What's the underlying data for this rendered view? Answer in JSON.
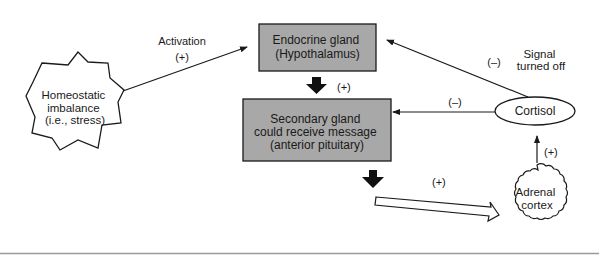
{
  "diagram": {
    "nodes": {
      "stress": {
        "lines": [
          "Homeostatic",
          "imbalance",
          "(i.e., stress)"
        ]
      },
      "endocrine": {
        "lines": [
          "Endocrine gland",
          "(Hypothalamus)"
        ]
      },
      "secondary": {
        "lines": [
          "Secondary gland",
          "could receive message",
          "(anterior pituitary)"
        ]
      },
      "cortisol": {
        "label": "Cortisol"
      },
      "adrenal": {
        "lines": [
          "Adrenal",
          "cortex"
        ]
      }
    },
    "edges": {
      "activation_label": "Activation",
      "activation_sign": "(+)",
      "endo_to_secondary_sign": "(+)",
      "secondary_to_adrenal_sign": "(+)",
      "adrenal_to_cortisol_sign": "(+)",
      "cortisol_to_secondary_sign": "(–)",
      "cortisol_to_endocrine_sign": "(–)",
      "signal_off_lines": [
        "Signal",
        "turned off"
      ]
    },
    "colors": {
      "box_fill": "#a8a8a8",
      "stroke": "#1a1a1a",
      "bottom_rule": "#9a9a9a"
    }
  }
}
